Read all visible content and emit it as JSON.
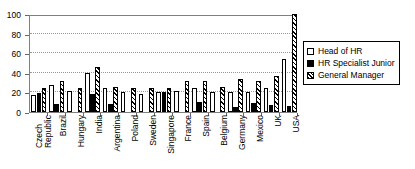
{
  "chart_data": {
    "type": "bar",
    "title": "",
    "subtitle": "",
    "xlabel": "",
    "ylabel": "",
    "ylim": [
      0,
      100
    ],
    "yticks": [
      0,
      20,
      40,
      60,
      80,
      100
    ],
    "ytick_labels": [
      "0",
      "20",
      "40",
      "60",
      "80",
      "100"
    ],
    "grid": true,
    "grid_axis": "y",
    "legend_position": "right",
    "categories": [
      "Czech Republic",
      "Brazil",
      "Hungary",
      "India",
      "Argentina",
      "Poland",
      "Sweden",
      "Singapore",
      "France",
      "Spain",
      "Belgium",
      "Germany",
      "Mexico",
      "UK",
      "USA"
    ],
    "category_lines": [
      [
        "Czech",
        "Republic"
      ],
      [
        "Brazil",
        ""
      ],
      [
        "Hungary",
        ""
      ],
      [
        "India",
        ""
      ],
      [
        "Argentina",
        ""
      ],
      [
        "Poland",
        ""
      ],
      [
        "Sweden",
        ""
      ],
      [
        "Singapore",
        ""
      ],
      [
        "France",
        ""
      ],
      [
        "Spain",
        ""
      ],
      [
        "Belgium",
        ""
      ],
      [
        "Germany",
        ""
      ],
      [
        "Mexico",
        ""
      ],
      [
        "UK",
        ""
      ],
      [
        "USA",
        ""
      ]
    ],
    "series": [
      {
        "name": "Head of HR",
        "key": "head",
        "fill": "white",
        "values": [
          17,
          28,
          21,
          40,
          24,
          20,
          18,
          20,
          21,
          25,
          20,
          20,
          20,
          25,
          54
        ]
      },
      {
        "name": "HR Specialist Junior",
        "key": "junior",
        "fill": "black",
        "values": [
          19,
          8,
          0,
          18,
          8,
          0,
          0,
          20,
          0,
          10,
          0,
          5,
          9,
          7,
          6
        ]
      },
      {
        "name": "General Manager",
        "key": "gm",
        "fill": "hatched",
        "values": [
          24,
          32,
          25,
          46,
          26,
          25,
          24,
          25,
          32,
          32,
          26,
          34,
          32,
          37,
          100
        ]
      }
    ]
  },
  "legend": {
    "items": [
      {
        "label": "Head of HR",
        "swatch": "white-square-icon"
      },
      {
        "label": "HR Specialist Junior",
        "swatch": "black-square-icon"
      },
      {
        "label": "General Manager",
        "swatch": "hatched-square-icon"
      }
    ]
  }
}
